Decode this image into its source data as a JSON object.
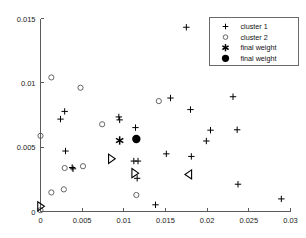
{
  "chart_data": {
    "type": "scatter",
    "title": "",
    "xlabel": "",
    "ylabel": "",
    "xlim": [
      0,
      0.03
    ],
    "ylim": [
      0,
      0.015
    ],
    "grid": false,
    "legend_position": "top-right",
    "xticks": [
      "0",
      "0.005",
      "0.01",
      "0.015",
      "0.02",
      "0.025",
      "0.03"
    ],
    "xtick_values": [
      0,
      0.005,
      0.01,
      0.015,
      0.02,
      0.025,
      0.03
    ],
    "yticks": [
      "0",
      "0.005",
      "0.01",
      "0.015"
    ],
    "ytick_values": [
      0,
      0.005,
      0.01,
      0.015
    ],
    "series": [
      {
        "name": "cluster 1",
        "marker": "plus",
        "color": "#000000",
        "points": [
          [
            0.0029,
            0.00778
          ],
          [
            0.0024,
            0.00718
          ],
          [
            0.003,
            0.0047
          ],
          [
            0.0038,
            0.00342
          ],
          [
            0.0039,
            0.00332
          ],
          [
            0.0094,
            0.00735
          ],
          [
            0.0095,
            0.00712
          ],
          [
            0.0114,
            0.00652
          ],
          [
            0.0112,
            0.00392
          ],
          [
            0.0117,
            0.00392
          ],
          [
            0.0116,
            0.00258
          ],
          [
            0.0138,
            0.00052
          ],
          [
            0.0151,
            0.00448
          ],
          [
            0.0156,
            0.00882
          ],
          [
            0.0175,
            0.01432
          ],
          [
            0.018,
            0.00792
          ],
          [
            0.0181,
            0.00428
          ],
          [
            0.0199,
            0.00548
          ],
          [
            0.0204,
            0.00632
          ],
          [
            0.0231,
            0.00892
          ],
          [
            0.0236,
            0.00635
          ],
          [
            0.0237,
            0.00212
          ],
          [
            0.0289,
            0.00098
          ]
        ]
      },
      {
        "name": "cluster 2",
        "marker": "circle",
        "color": "#555555",
        "points": [
          [
            0.0013,
            0.01042
          ],
          [
            0.0048,
            0.00962
          ],
          [
            0.0,
            0.00588
          ],
          [
            0.0074,
            0.00678
          ],
          [
            0.0142,
            0.00858
          ],
          [
            0.0029,
            0.00338
          ],
          [
            0.0051,
            0.00352
          ],
          [
            0.0028,
            0.00172
          ],
          [
            0.0013,
            0.00148
          ],
          [
            0.0115,
            0.00128
          ],
          [
            0.0,
            0.0001
          ]
        ]
      },
      {
        "name": "final weight",
        "marker": "asterisk",
        "color": "#000000",
        "points": [
          [
            0.0095,
            0.00552
          ]
        ]
      },
      {
        "name": "final weight",
        "marker": "filled-circle",
        "color": "#000000",
        "points": [
          [
            0.0115,
            0.00563
          ]
        ]
      }
    ],
    "annotations": [
      {
        "marker": "triangle-right",
        "x": 0.0085,
        "y": 0.0041
      },
      {
        "marker": "triangle-right",
        "x": 0.0113,
        "y": 0.00298
      },
      {
        "marker": "triangle-left",
        "x": 0.0178,
        "y": 0.00288
      },
      {
        "marker": "triangle-right",
        "x": 0.0,
        "y": 0.0004
      }
    ]
  },
  "legend": {
    "entries": [
      {
        "label": "cluster 1",
        "marker": "plus"
      },
      {
        "label": "cluster 2",
        "marker": "circle"
      },
      {
        "label": "final weight",
        "marker": "asterisk"
      },
      {
        "label": "final weight",
        "marker": "filled-circle"
      }
    ]
  }
}
